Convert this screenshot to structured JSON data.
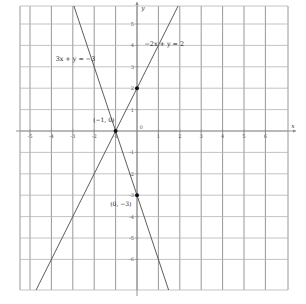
{
  "chart_data": {
    "type": "line",
    "title": "",
    "xlabel": "x",
    "ylabel": "y",
    "xlim": [
      -5.6,
      6.4
    ],
    "ylim": [
      -6.6,
      5.6
    ],
    "grid": true,
    "legend": "none",
    "x_ticks": [
      -5,
      -4,
      -3,
      -2,
      -1,
      0,
      1,
      2,
      3,
      4,
      5,
      6
    ],
    "x_tick_labels": [
      "-5",
      "-4",
      "-3",
      "-2",
      "-1",
      "0",
      "1",
      "2",
      "3",
      "4",
      "5",
      "6"
    ],
    "y_ticks": [
      5,
      4,
      3,
      2,
      1,
      0,
      -1,
      -2,
      -3,
      -4,
      -5,
      -6
    ],
    "y_tick_labels": [
      "5",
      "4",
      "3",
      "2",
      "1",
      "0",
      "-1",
      "-2",
      "-3",
      "-4",
      "-5",
      "-6"
    ],
    "series": [
      {
        "name": "3x + y = -3",
        "label": "3x + y = −3",
        "slope": -3,
        "intercept": -3,
        "color": "#4a4a4a",
        "points": [
          [
            -1,
            0
          ],
          [
            0,
            -3
          ]
        ]
      },
      {
        "name": "-2x + y = 2",
        "label": "−2x + y = 2",
        "slope": 2,
        "intercept": 2,
        "color": "#4a4a4a",
        "points": [
          [
            -1,
            0
          ],
          [
            0,
            2
          ]
        ]
      }
    ],
    "annotations": [
      {
        "text": "3x + y = −3",
        "x": -3.8,
        "y": 3.25,
        "kind": "equation-label"
      },
      {
        "text": "−2x + y = 2",
        "x": 0.35,
        "y": 3.95,
        "kind": "equation-label"
      },
      {
        "text": "(−1, 0)",
        "x": -2.05,
        "y": 0.42,
        "kind": "point-label"
      },
      {
        "text": "(0, −3)",
        "x": -1.25,
        "y": -3.52,
        "kind": "point-label"
      }
    ],
    "marked_points": [
      {
        "label": "(−1, 0)",
        "x": -1,
        "y": 0
      },
      {
        "label": "",
        "x": 0,
        "y": 2
      },
      {
        "label": "(0, −3)",
        "x": 0,
        "y": -3
      }
    ]
  },
  "axis": {
    "x_name": "x",
    "y_name": "y"
  },
  "colors": {
    "grid_vertical": "#7d7d7d",
    "grid_horizontal": "#b4b4b4",
    "axis": "#888888",
    "line": "#4a4a4a",
    "point": "#111111",
    "background": "#ffffff"
  }
}
